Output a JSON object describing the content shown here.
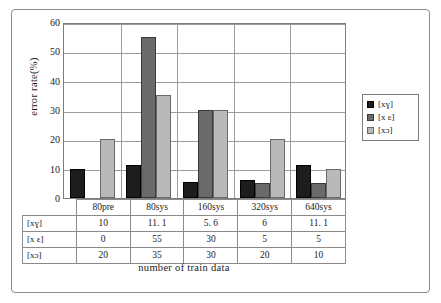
{
  "chart_data": {
    "type": "bar",
    "title": "",
    "subtitle": "",
    "xlabel": "number of train data",
    "ylabel": "error rate(%)",
    "categories": [
      "80pre",
      "80sys",
      "160sys",
      "320sys",
      "640sys"
    ],
    "series": [
      {
        "name": "[xɣ]",
        "color": "#1d1d1d",
        "values": [
          10,
          11.1,
          5.6,
          6,
          11.1
        ]
      },
      {
        "name": "[x ɛ]",
        "color": "#6a6a6a",
        "values": [
          0,
          55,
          30,
          5,
          5
        ]
      },
      {
        "name": "[xɔ]",
        "color": "#b9b9b9",
        "values": [
          20,
          35,
          30,
          20,
          10
        ]
      }
    ],
    "ylim": [
      0,
      60
    ],
    "yticks": [
      0,
      10,
      20,
      30,
      40,
      50,
      60
    ],
    "ytick_labels": [
      "0",
      "10",
      "20",
      "30",
      "40",
      "50",
      "60"
    ],
    "grid": true,
    "grid_axis": "y",
    "legend_position": "right",
    "table": {
      "header": [
        "",
        "80pre",
        "80sys",
        "160sys",
        "320sys",
        "640sys"
      ],
      "rows": [
        {
          "label": "[xɣ]",
          "values": [
            "10",
            "11. 1",
            "5. 6",
            "6",
            "11. 1"
          ]
        },
        {
          "label": "[x ɛ]",
          "values": [
            "0",
            "55",
            "30",
            "5",
            "5"
          ]
        },
        {
          "label": "[xɔ]",
          "values": [
            "20",
            "35",
            "30",
            "20",
            "10"
          ]
        }
      ]
    }
  }
}
